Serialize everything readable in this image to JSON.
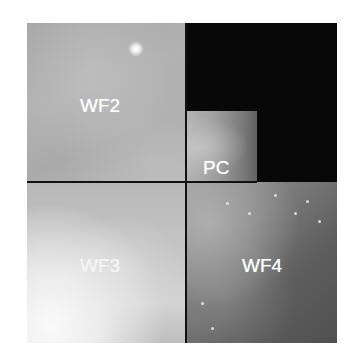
{
  "figure": {
    "chips": [
      {
        "id": "wf2",
        "label": "WF2"
      },
      {
        "id": "pc",
        "label": "PC"
      },
      {
        "id": "wf3",
        "label": "WF3"
      },
      {
        "id": "wf4",
        "label": "WF4"
      }
    ],
    "colors": {
      "background": "#ffffff",
      "empty_region": "#080808",
      "divider": "#111111",
      "label": "#ffffff"
    }
  }
}
